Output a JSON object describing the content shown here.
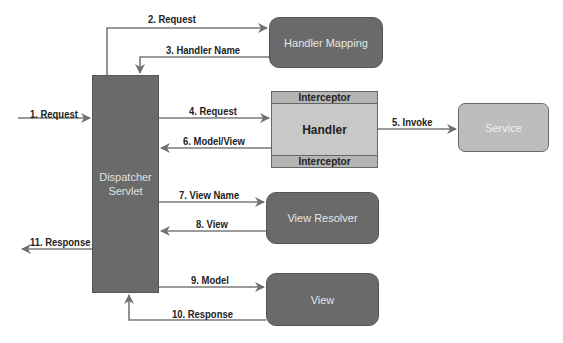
{
  "diagram": {
    "components": {
      "dispatcher_servlet": {
        "line1": "Dispatcher",
        "line2": "Servlet"
      },
      "handler_mapping": "Handler Mapping",
      "handler": {
        "label": "Handler",
        "interceptor_top": "Interceptor",
        "interceptor_bottom": "Interceptor"
      },
      "service": "Service",
      "view_resolver": "View Resolver",
      "view": "View"
    },
    "arrows": [
      {
        "step": 1,
        "label": "1. Request"
      },
      {
        "step": 2,
        "label": "2. Request"
      },
      {
        "step": 3,
        "label": "3. Handler Name"
      },
      {
        "step": 4,
        "label": "4. Request"
      },
      {
        "step": 5,
        "label": "5. Invoke"
      },
      {
        "step": 6,
        "label": "6. Model/View"
      },
      {
        "step": 7,
        "label": "7. View Name"
      },
      {
        "step": 8,
        "label": "8. View"
      },
      {
        "step": 9,
        "label": "9. Model"
      },
      {
        "step": 10,
        "label": "10. Response"
      },
      {
        "step": 11,
        "label": "11. Response"
      }
    ],
    "colors": {
      "dark_box": "#6a6a6a",
      "light_box": "#bdbdbd",
      "handler": "#c8c8c8",
      "arrow": "#777777",
      "text": "#222222"
    }
  }
}
